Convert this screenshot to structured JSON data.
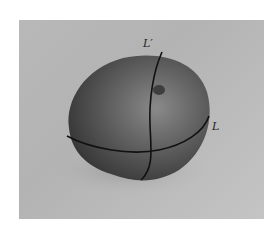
{
  "figure": {
    "curves": [
      {
        "id": "L",
        "label": "L",
        "description": "horizontal curve around the fruit"
      },
      {
        "id": "L-prime",
        "label": "L′",
        "description": "vertical curve over the fruit"
      }
    ],
    "colors": {
      "background": "#b8b8b8",
      "fruit_dark": "#3a3a3a",
      "fruit_mid": "#606060",
      "fruit_highlight": "#8a8a8a",
      "curve": "#111111"
    }
  }
}
